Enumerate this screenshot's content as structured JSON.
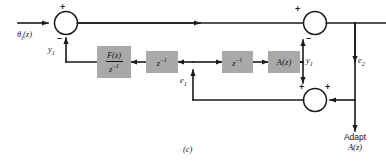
{
  "figure": {
    "caption": "(c)",
    "type": "block-diagram"
  },
  "colors": {
    "block_fill": "#a9a9a9",
    "line": "#1a1a1a",
    "background": "#ffffff",
    "text": "#1a1a1a"
  },
  "signals": {
    "input": "θ",
    "input_sub": "i",
    "input_arg": "(z)",
    "y1_left": "y",
    "y1_left_sub": "1",
    "y1_right": "y",
    "y1_right_sub": "1",
    "e1": "e",
    "e1_sub": "1",
    "e2": "e",
    "e2_sub": "2"
  },
  "blocks": [
    {
      "name": "F(z)/z^-1",
      "numerator": "F(z)",
      "denominator_base": "z",
      "denominator_exp": "–1",
      "kind": "fraction"
    },
    {
      "name": "z^-1 (left)",
      "base": "z",
      "exp": "–1",
      "kind": "power"
    },
    {
      "name": "z^-1 (right)",
      "base": "z",
      "exp": "–1",
      "kind": "power"
    },
    {
      "name": "A(z)",
      "label": "A(z)",
      "kind": "plain"
    }
  ],
  "summers": {
    "left": {
      "name": "left-summing-junction",
      "top_sign": "+",
      "bottom_sign": "–"
    },
    "top_right": {
      "name": "top-right-summing-junction",
      "left_sign": "+",
      "bottom_sign": "–"
    },
    "bottom_right": {
      "name": "bottom-right-summing-junction",
      "top_sign": "+",
      "right_sign": "+"
    }
  },
  "adapt": {
    "line1": "Adapt",
    "line2": "A(z)"
  }
}
